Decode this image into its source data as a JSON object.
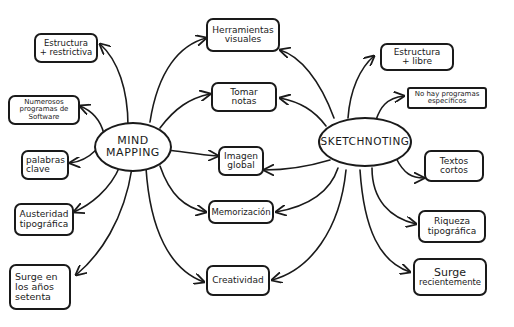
{
  "diagram": {
    "colors": {
      "ink": "#1a1a1a",
      "background": "#ffffff"
    },
    "centers": {
      "mind_mapping": {
        "line1": "MIND",
        "line2": "MAPPING"
      },
      "sketchnoting": {
        "label": "SKETCHNOTING"
      }
    },
    "mind_mapping_only": [
      {
        "line1": "Estructura",
        "line2": "+ restrictiva"
      },
      {
        "line1": "Numerosos",
        "line2": "programas de",
        "line3": "Software"
      },
      {
        "line1": "palabras",
        "line2": "clave"
      },
      {
        "line1": "Austeridad",
        "line2": "tipográfica"
      },
      {
        "line1": "Surge en",
        "line2": "los años",
        "line3": "setenta"
      }
    ],
    "shared": [
      {
        "line1": "Herramientas",
        "line2": "visuales"
      },
      {
        "line1": "Tomar",
        "line2": "notas"
      },
      {
        "line1": "Imagen",
        "line2": "global"
      },
      {
        "line1": "Memorización"
      },
      {
        "line1": "Creatividad"
      }
    ],
    "sketchnoting_only": [
      {
        "line1": "Estructura",
        "line2": "+ libre"
      },
      {
        "line1": "No hay programas",
        "line2": "específicos"
      },
      {
        "line1": "Textos",
        "line2": "cortos"
      },
      {
        "line1": "Riqueza",
        "line2": "tipográfica"
      },
      {
        "line1": "Surge",
        "line2": "recientemente"
      }
    ]
  }
}
